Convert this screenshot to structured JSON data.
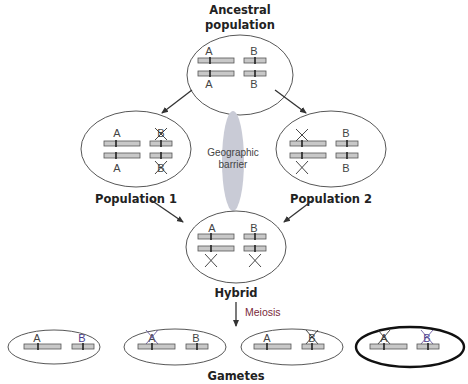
{
  "titles": {
    "ancestral_line1": "Ancestral",
    "ancestral_line2": "population",
    "population1": "Population 1",
    "population2": "Population 2",
    "hybrid": "Hybrid",
    "gametes": "Gametes"
  },
  "barrier": {
    "line1": "Geographic",
    "line2": "barrier"
  },
  "process": {
    "meiosis": "Meiosis"
  },
  "alleles": {
    "A": "A",
    "B": "B"
  },
  "colors": {
    "chromosome_fill": "#c8c8c8",
    "barrier": "#c9cbd6",
    "meiosis_text": "#7a2a3a",
    "gamete_b": "#4a3c8c"
  },
  "populations": [
    {
      "name": "Ancestral population",
      "top": [
        "A",
        "B"
      ],
      "bottom": [
        "A",
        "B"
      ],
      "crossed": []
    },
    {
      "name": "Population 1",
      "top": [
        "A",
        "B"
      ],
      "bottom": [
        "A",
        "B"
      ],
      "crossed": [
        "B-top",
        "B-bottom"
      ]
    },
    {
      "name": "Population 2",
      "top": [
        "A",
        "B"
      ],
      "bottom": [
        "A",
        "B"
      ],
      "crossed": [
        "A-top",
        "A-bottom"
      ]
    },
    {
      "name": "Hybrid",
      "top": [
        "A",
        "B"
      ],
      "bottom": [
        "a",
        "b"
      ],
      "crossed": [
        "A-bottom",
        "B-bottom"
      ]
    }
  ],
  "gametes": [
    {
      "alleles": [
        "A",
        "B"
      ],
      "crossed": [],
      "highlighted": false
    },
    {
      "alleles": [
        "A",
        "B"
      ],
      "crossed": [
        "A"
      ],
      "highlighted": false
    },
    {
      "alleles": [
        "A",
        "B"
      ],
      "crossed": [
        "B"
      ],
      "highlighted": false
    },
    {
      "alleles": [
        "A",
        "B"
      ],
      "crossed": [
        "A",
        "B"
      ],
      "highlighted": true
    }
  ]
}
